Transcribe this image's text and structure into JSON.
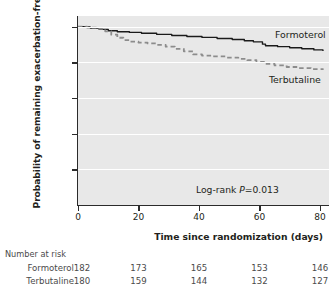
{
  "chart_data": {
    "type": "line",
    "title": "",
    "xlabel": "Time since randomization (days)",
    "ylabel": "Probability of remaining exacerbation-free",
    "xlim": [
      0,
      83
    ],
    "ylim": [
      0,
      1.06
    ],
    "xticks": [
      0,
      20,
      40,
      60,
      80
    ],
    "xtick_labels": [
      "0",
      "20",
      "40",
      "60",
      "80"
    ],
    "yticks": [
      0.2,
      0.4,
      0.6,
      0.8,
      1.0
    ],
    "ytick_labels": [
      "0.2",
      "0.4",
      "0.6",
      "0.8",
      "1.0"
    ],
    "y_origin_label": "0",
    "grid": true,
    "legend_position": "inline-right",
    "annotation": {
      "prefix": "Log-rank ",
      "italic": "P",
      "suffix": "=0.013"
    },
    "series": [
      {
        "name": "Formoterol",
        "style": "solid",
        "color": "#1a1a1a",
        "label_x": 81,
        "label_y": 0.955,
        "points": [
          [
            0,
            1.0
          ],
          [
            2,
            0.998
          ],
          [
            4,
            0.992
          ],
          [
            7,
            0.985
          ],
          [
            10,
            0.977
          ],
          [
            13,
            0.972
          ],
          [
            17,
            0.968
          ],
          [
            21,
            0.963
          ],
          [
            26,
            0.957
          ],
          [
            31,
            0.951
          ],
          [
            36,
            0.945
          ],
          [
            41,
            0.94
          ],
          [
            46,
            0.934
          ],
          [
            51,
            0.928
          ],
          [
            55,
            0.921
          ],
          [
            58,
            0.915
          ],
          [
            61,
            0.902
          ],
          [
            62,
            0.893
          ],
          [
            66,
            0.888
          ],
          [
            70,
            0.882
          ],
          [
            74,
            0.876
          ],
          [
            78,
            0.87
          ],
          [
            81,
            0.864
          ]
        ]
      },
      {
        "name": "Terbutaline",
        "style": "dashed",
        "color": "#8c8c8c",
        "label_x": 79,
        "label_y": 0.7,
        "points": [
          [
            0,
            1.0
          ],
          [
            3,
            0.995
          ],
          [
            6,
            0.988
          ],
          [
            9,
            0.974
          ],
          [
            11,
            0.955
          ],
          [
            13,
            0.938
          ],
          [
            15,
            0.925
          ],
          [
            17,
            0.916
          ],
          [
            20,
            0.911
          ],
          [
            23,
            0.906
          ],
          [
            26,
            0.898
          ],
          [
            29,
            0.888
          ],
          [
            32,
            0.876
          ],
          [
            35,
            0.862
          ],
          [
            38,
            0.845
          ],
          [
            41,
            0.838
          ],
          [
            45,
            0.833
          ],
          [
            49,
            0.827
          ],
          [
            53,
            0.82
          ],
          [
            56,
            0.812
          ],
          [
            59,
            0.802
          ],
          [
            62,
            0.791
          ],
          [
            65,
            0.783
          ],
          [
            69,
            0.774
          ],
          [
            73,
            0.768
          ],
          [
            77,
            0.762
          ],
          [
            81,
            0.758
          ]
        ]
      }
    ],
    "risk_table": {
      "title": "Number at risk",
      "time_points": [
        0,
        20,
        40,
        60,
        80
      ],
      "rows": [
        {
          "label": "Formoterol",
          "values": [
            "182",
            "173",
            "165",
            "153",
            "146"
          ]
        },
        {
          "label": "Terbutaline",
          "values": [
            "180",
            "159",
            "144",
            "132",
            "127"
          ]
        }
      ]
    }
  }
}
